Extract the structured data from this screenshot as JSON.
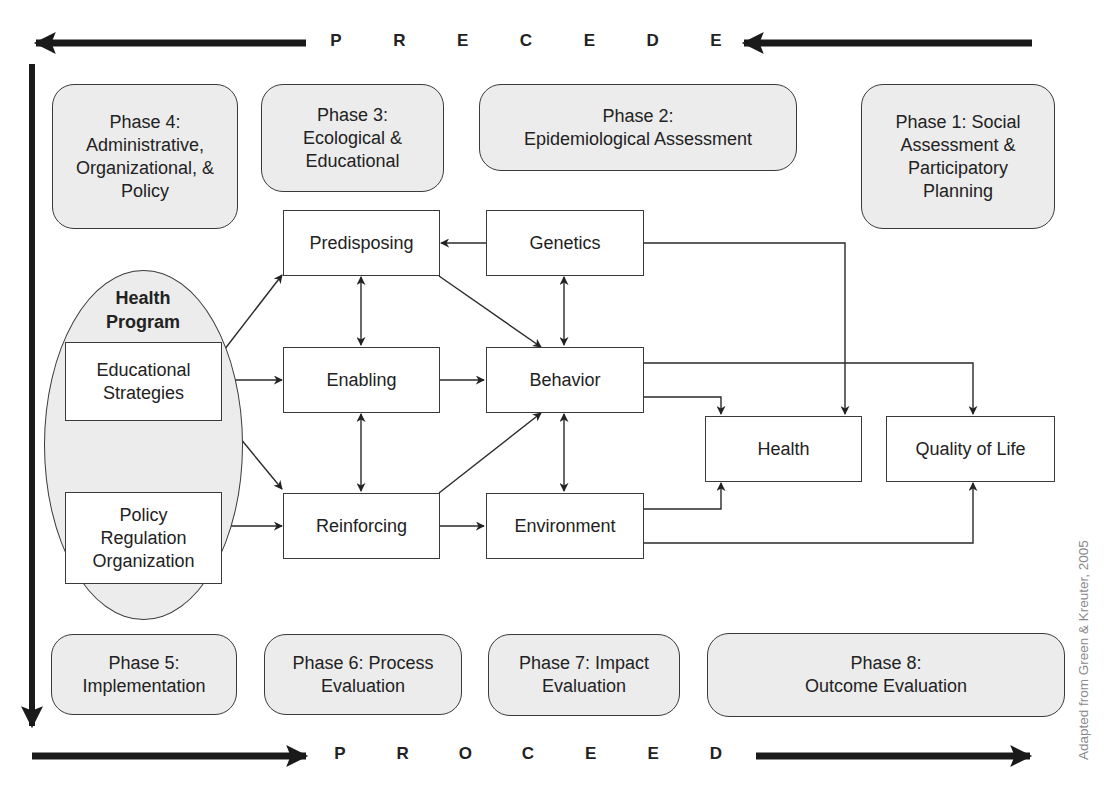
{
  "banners": {
    "precede": {
      "letters": [
        "P",
        "R",
        "E",
        "C",
        "E",
        "D",
        "E"
      ],
      "direction": "right-to-left"
    },
    "proceed": {
      "letters": [
        "P",
        "R",
        "O",
        "C",
        "E",
        "E",
        "D"
      ],
      "direction": "left-to-right"
    }
  },
  "phases_top": [
    {
      "id": "phase4",
      "label": "Phase 4:\nAdministrative,\nOrganizational, &\nPolicy"
    },
    {
      "id": "phase3",
      "label": "Phase 3:\nEcological &\nEducational"
    },
    {
      "id": "phase2",
      "label": "Phase 2:\nEpidemiological Assessment"
    },
    {
      "id": "phase1",
      "label": "Phase 1: Social\nAssessment &\nParticipatory\nPlanning"
    }
  ],
  "phases_bottom": [
    {
      "id": "phase5",
      "label": "Phase 5:\nImplementation"
    },
    {
      "id": "phase6",
      "label": "Phase 6: Process\nEvaluation"
    },
    {
      "id": "phase7",
      "label": "Phase 7: Impact\nEvaluation"
    },
    {
      "id": "phase8",
      "label": "Phase 8:\nOutcome Evaluation"
    }
  ],
  "health_program": {
    "title": "Health\nProgram",
    "components": [
      {
        "id": "educational",
        "label": "Educational\nStrategies"
      },
      {
        "id": "policy",
        "label": "Policy\nRegulation\nOrganization"
      }
    ]
  },
  "factors": [
    {
      "id": "predisposing",
      "label": "Predisposing"
    },
    {
      "id": "enabling",
      "label": "Enabling"
    },
    {
      "id": "reinforcing",
      "label": "Reinforcing"
    }
  ],
  "determinants": [
    {
      "id": "genetics",
      "label": "Genetics"
    },
    {
      "id": "behavior",
      "label": "Behavior"
    },
    {
      "id": "environment",
      "label": "Environment"
    }
  ],
  "outcomes": [
    {
      "id": "health",
      "label": "Health"
    },
    {
      "id": "quality_of_life",
      "label": "Quality of Life"
    }
  ],
  "edges": [
    {
      "from": "educational",
      "to": "predisposing"
    },
    {
      "from": "educational",
      "to": "enabling"
    },
    {
      "from": "educational",
      "to": "reinforcing"
    },
    {
      "from": "educational",
      "to": "policy",
      "bidirectional": true
    },
    {
      "from": "policy",
      "to": "reinforcing"
    },
    {
      "from": "predisposing",
      "to": "enabling",
      "bidirectional": true
    },
    {
      "from": "enabling",
      "to": "reinforcing",
      "bidirectional": true
    },
    {
      "from": "genetics",
      "to": "predisposing"
    },
    {
      "from": "predisposing",
      "to": "behavior"
    },
    {
      "from": "enabling",
      "to": "behavior"
    },
    {
      "from": "reinforcing",
      "to": "behavior"
    },
    {
      "from": "reinforcing",
      "to": "environment"
    },
    {
      "from": "genetics",
      "to": "behavior",
      "bidirectional": true
    },
    {
      "from": "behavior",
      "to": "environment",
      "bidirectional": true
    },
    {
      "from": "genetics",
      "to": "health"
    },
    {
      "from": "behavior",
      "to": "health"
    },
    {
      "from": "behavior",
      "to": "quality_of_life"
    },
    {
      "from": "environment",
      "to": "health"
    },
    {
      "from": "environment",
      "to": "quality_of_life"
    }
  ],
  "credit": "Adapted from Green & Kreuter, 2005",
  "colors": {
    "phase_fill": "#ececec",
    "stroke": "#2a2a2a",
    "banner_arrow": "#1a1a1a",
    "credit_text": "#8a8a8a"
  }
}
